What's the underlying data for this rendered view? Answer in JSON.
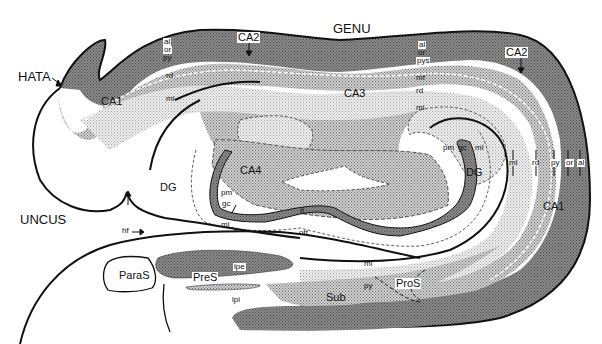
{
  "figure": {
    "colors": {
      "dark_layer": "#6e6e6e",
      "medium_dots": "#a8a8a8",
      "light_dots": "#d8d8d8",
      "outline": "#111111",
      "background": "#ffffff"
    }
  },
  "regions": {
    "genu": "GENU",
    "uncus": "UNCUS",
    "hata": "HATA",
    "ca1_left": "CA1",
    "ca1_right": "CA1",
    "ca2_left": "CA2",
    "ca2_right": "CA2",
    "ca3": "CA3",
    "ca4": "CA4",
    "dg_left": "DG",
    "dg_right": "DG",
    "paras": "ParaS",
    "pres": "PreS",
    "pros": "ProS",
    "sub": "Sub"
  },
  "layers": {
    "top_al": "al",
    "top_or": "or",
    "top_py": "py",
    "left_rd": "rd",
    "left_ml": "ml",
    "mid_al": "al",
    "mid_or": "or",
    "mid_pys": "pys",
    "mid_mf": "mf",
    "mid_rd": "rd",
    "mid_ml": "ml",
    "right_ml": "ml",
    "right_rd": "rd",
    "right_py": "py",
    "right_or": "or",
    "right_al": "al",
    "dg_pm": "pm",
    "dg_gc": "gc",
    "dg_ml": "ml",
    "ca4_pm": "pm",
    "ca4_gc": "gc",
    "ca4_ml": "ml",
    "it": "it",
    "ott": "ott",
    "hf": "hf",
    "lower_ml": "ml",
    "sub_py": "py",
    "lpe": "lpe",
    "lpi": "lpi"
  }
}
